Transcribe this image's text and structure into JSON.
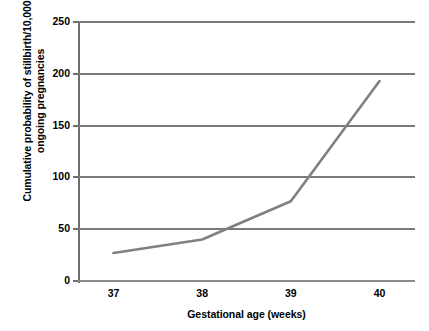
{
  "chart_data": {
    "type": "line",
    "title": "",
    "xlabel": "Gestational age (weeks)",
    "ylabel_line1": "Cumulative probability of stillbirth/10,000",
    "ylabel_line2": "ongoing pregnancies",
    "x": [
      37,
      38,
      39,
      40
    ],
    "xtick_labels": [
      "37",
      "38",
      "39",
      "40"
    ],
    "values": [
      27,
      40,
      77,
      193
    ],
    "series": [
      {
        "name": "Cumulative probability of stillbirth/10,000 ongoing pregnancies",
        "values": [
          27,
          40,
          77,
          193
        ]
      }
    ],
    "ylim": [
      0,
      250
    ],
    "xlim": [
      36.6,
      40.4
    ],
    "yticks": [
      0,
      50,
      100,
      150,
      200,
      250
    ],
    "ytick_labels": [
      "0",
      "50",
      "100",
      "150",
      "200",
      "250"
    ],
    "grid": true,
    "grid_axis": "y",
    "legend": false,
    "legend_position": "none",
    "line_color": "#808080",
    "grid_color": "#7a7a7a",
    "background_color": "#ffffff",
    "text_color": "#000000"
  }
}
